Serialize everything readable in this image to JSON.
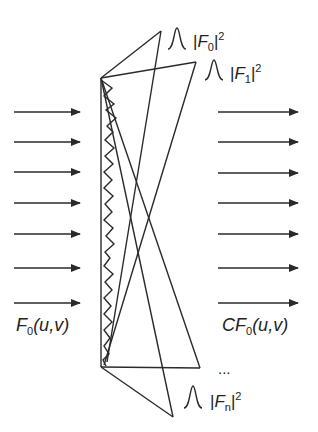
{
  "diagram": {
    "input_label": {
      "func": "F",
      "sub": "0",
      "args": "(u,v)"
    },
    "output_label": {
      "prefix": "C",
      "func": "F",
      "sub": "0",
      "args": "(u,v)"
    },
    "peaks": [
      {
        "func": "F",
        "sub": "0",
        "sup": "2"
      },
      {
        "func": "F",
        "sub": "1",
        "sup": "2"
      },
      {
        "func": "F",
        "sub": "n",
        "sup": "2"
      }
    ],
    "ellipsis": "...",
    "input_arrow_count": 7,
    "output_arrow_count": 7,
    "stroke_color": "#2a2a2a"
  }
}
